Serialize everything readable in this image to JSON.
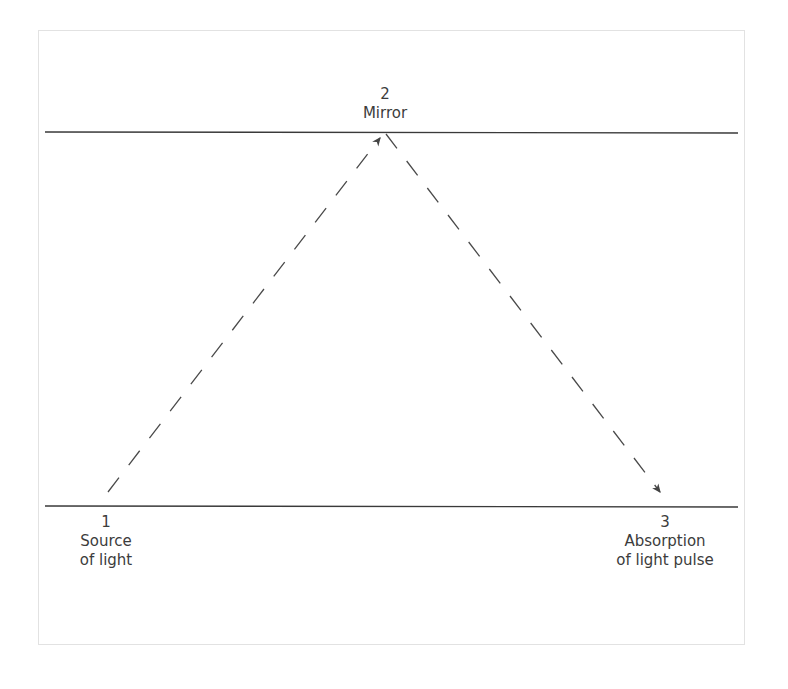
{
  "diagram": {
    "points": [
      {
        "number": "1",
        "lines": [
          "Source",
          "of light"
        ]
      },
      {
        "number": "2",
        "lines": [
          "Mirror"
        ]
      },
      {
        "number": "3",
        "lines": [
          "Absorption",
          "of light pulse"
        ]
      }
    ],
    "colors": {
      "line": "#3a3a3a",
      "dash": "#4a4a4a",
      "frame": "#e2e2e2",
      "text": "#3c3c3c"
    }
  }
}
